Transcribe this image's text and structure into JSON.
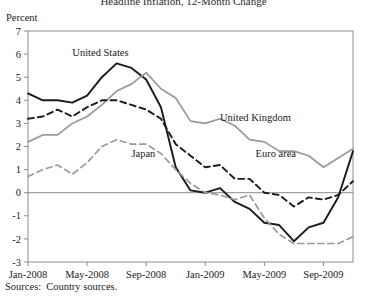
{
  "chart_data": {
    "type": "line",
    "title": "Headline Inflation, 12-Month Change",
    "ylabel": "Percent",
    "xlabel": "",
    "ylim": [
      -3,
      7
    ],
    "y_ticks": [
      "7",
      "6",
      "5",
      "4",
      "3",
      "2",
      "1",
      "0",
      "-1",
      "-2",
      "-3"
    ],
    "y_tick_values": [
      7,
      6,
      5,
      4,
      3,
      2,
      1,
      0,
      -1,
      -2,
      -3
    ],
    "x_tick_labels": [
      "Jan-2008",
      "May-2008",
      "Sep-2008",
      "Jan-2009",
      "May-2009",
      "Sep-2009"
    ],
    "x_tick_values": [
      0,
      4,
      8,
      12,
      16,
      20
    ],
    "x": [
      0,
      1,
      2,
      3,
      4,
      5,
      6,
      7,
      8,
      9,
      10,
      11,
      12,
      13,
      14,
      15,
      16,
      17,
      18,
      19,
      20,
      21,
      22
    ],
    "x_labels_full": [
      "Jan-2008",
      "Feb-2008",
      "Mar-2008",
      "Apr-2008",
      "May-2008",
      "Jun-2008",
      "Jul-2008",
      "Aug-2008",
      "Sep-2008",
      "Oct-2008",
      "Nov-2008",
      "Dec-2008",
      "Jan-2009",
      "Feb-2009",
      "Mar-2009",
      "Apr-2009",
      "May-2009",
      "Jun-2009",
      "Jul-2009",
      "Aug-2009",
      "Sep-2009",
      "Oct-2009",
      "Nov-2009"
    ],
    "grid": false,
    "zero_line": true,
    "legend_position": "inline-annotations",
    "series": [
      {
        "name": "United States",
        "color": "#1a1a1a",
        "style": "solid",
        "label_x": 3.0,
        "label_y": 5.9,
        "values": [
          4.3,
          4.0,
          4.0,
          3.9,
          4.2,
          5.0,
          5.6,
          5.4,
          4.9,
          3.7,
          1.1,
          0.1,
          0.0,
          0.2,
          -0.4,
          -0.7,
          -1.3,
          -1.4,
          -2.1,
          -1.5,
          -1.3,
          -0.2,
          1.8
        ]
      },
      {
        "name": "United Kingdom",
        "color": "#9a9a9a",
        "style": "solid",
        "label_x": 13.0,
        "label_y": 3.1,
        "values": [
          2.2,
          2.5,
          2.5,
          3.0,
          3.3,
          3.8,
          4.4,
          4.7,
          5.2,
          4.5,
          4.1,
          3.1,
          3.0,
          3.2,
          2.9,
          2.3,
          2.2,
          1.8,
          1.8,
          1.6,
          1.1,
          1.5,
          1.9
        ]
      },
      {
        "name": "Euro area",
        "color": "#1a1a1a",
        "style": "dashed",
        "label_x": 15.4,
        "label_y": 1.55,
        "values": [
          3.2,
          3.3,
          3.6,
          3.3,
          3.7,
          4.0,
          4.0,
          3.8,
          3.6,
          3.2,
          2.1,
          1.6,
          1.1,
          1.2,
          0.6,
          0.6,
          0.0,
          -0.1,
          -0.6,
          -0.2,
          -0.3,
          -0.1,
          0.5
        ]
      },
      {
        "name": "Japan",
        "color": "#9a9a9a",
        "style": "dashed",
        "label_x": 7.0,
        "label_y": 1.55,
        "values": [
          0.7,
          1.0,
          1.2,
          0.8,
          1.3,
          2.0,
          2.3,
          2.1,
          2.1,
          1.7,
          1.0,
          0.4,
          0.0,
          -0.1,
          -0.3,
          -0.1,
          -1.1,
          -1.8,
          -2.2,
          -2.2,
          -2.2,
          -2.2,
          -1.9
        ]
      }
    ]
  },
  "source": {
    "label": "Sources:",
    "text": "Country sources."
  }
}
